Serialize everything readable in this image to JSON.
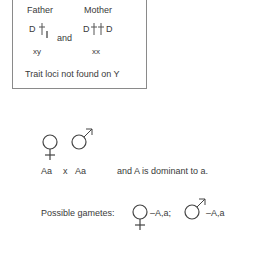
{
  "box": {
    "father_label": "Father",
    "mother_label": "Mother",
    "father_allele": "D",
    "mother_allele_left": "D",
    "mother_allele_right": "D",
    "connector": "and",
    "father_sex_chromosomes": "xy",
    "mother_sex_chromosomes": "xx",
    "note": "Trait loci not found on Y"
  },
  "cross": {
    "female_genotype": "Aa",
    "cross_symbol": "x",
    "male_genotype": "Aa",
    "dominance_note": "and A is dominant to a."
  },
  "gametes": {
    "label": "Possible gametes:",
    "female_gametes": "–A,a;",
    "male_gametes": "–A,a"
  },
  "icons": {
    "female": "female-symbol-icon",
    "male": "male-symbol-icon",
    "chromosome": "chromosome-icon"
  },
  "colors": {
    "text": "#3a3a3a",
    "border": "#8a8a8a",
    "background": "#ffffff"
  }
}
